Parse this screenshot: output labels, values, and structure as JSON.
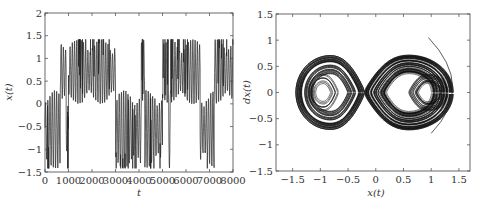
{
  "chart_data": [
    {
      "type": "line",
      "title": "",
      "xlabel": "t",
      "ylabel": "x(t)",
      "xlim": [
        0,
        8000
      ],
      "ylim": [
        -1.5,
        2
      ],
      "xticks": [
        0,
        1000,
        2000,
        3000,
        4000,
        5000,
        6000,
        7000,
        8000
      ],
      "xtick_labels": [
        "0",
        "1000",
        "2000",
        "3000",
        "4000",
        "5000",
        "6000",
        "7000",
        "8000"
      ],
      "yticks": [
        -1.5,
        -1,
        -0.5,
        0,
        0.5,
        1,
        1.5,
        2
      ],
      "ytick_labels": [
        "−1.5",
        "−1",
        "−0.5",
        "0",
        "0.5",
        "1",
        "1.5",
        "2"
      ],
      "grid": false,
      "legend": null,
      "series": [
        {
          "name": "x(t)",
          "description": "chaotic time series switching between two wells",
          "regimes": [
            {
              "t_start": 0,
              "t_end": 650,
              "well": "negative"
            },
            {
              "t_start": 650,
              "t_end": 900,
              "well": "positive"
            },
            {
              "t_start": 900,
              "t_end": 1000,
              "well": "negative"
            },
            {
              "t_start": 1000,
              "t_end": 3000,
              "well": "positive"
            },
            {
              "t_start": 3000,
              "t_end": 4100,
              "well": "negative"
            },
            {
              "t_start": 4100,
              "t_end": 4250,
              "well": "positive"
            },
            {
              "t_start": 4250,
              "t_end": 5000,
              "well": "negative"
            },
            {
              "t_start": 5000,
              "t_end": 5250,
              "well": "positive"
            },
            {
              "t_start": 5250,
              "t_end": 5350,
              "well": "negative"
            },
            {
              "t_start": 5350,
              "t_end": 6600,
              "well": "positive"
            },
            {
              "t_start": 6600,
              "t_end": 7200,
              "well": "negative"
            },
            {
              "t_start": 7200,
              "t_end": 8000,
              "well": "positive"
            }
          ],
          "positive_well": {
            "min": 0.0,
            "max": 1.42
          },
          "negative_well": {
            "min": -1.42,
            "max": 0.3
          }
        }
      ]
    },
    {
      "type": "line",
      "title": "",
      "xlabel": "x(t)",
      "ylabel": "dx(t)",
      "xlim": [
        -1.8,
        1.7
      ],
      "ylim": [
        -1.5,
        1.5
      ],
      "xticks": [
        -1.5,
        -1,
        -0.5,
        0,
        0.5,
        1,
        1.5
      ],
      "xtick_labels": [
        "−1.5",
        "−1",
        "−0.5",
        "0",
        "0.5",
        "1",
        "1.5"
      ],
      "yticks": [
        -1.5,
        -1,
        -0.5,
        0,
        0.5,
        1,
        1.5
      ],
      "ytick_labels": [
        "−1.5",
        "−1",
        "−0.5",
        "0",
        "0.5",
        "1",
        "1.5"
      ],
      "grid": false,
      "legend": null,
      "series": [
        {
          "name": "phase portrait",
          "description": "double-scroll attractor with foci near x=-1 and x=1",
          "left_lobe": {
            "center": [
              -0.95,
              0.0
            ],
            "x_extent": [
              -1.45,
              -0.2
            ],
            "y_extent": [
              -0.75,
              0.68
            ]
          },
          "right_lobe": {
            "center": [
              0.95,
              0.0
            ],
            "x_extent": [
              -0.2,
              1.4
            ],
            "y_extent": [
              -0.65,
              0.78
            ]
          },
          "transient_arc": {
            "start": [
              0.95,
              1.05
            ],
            "end": [
              1.0,
              -0.78
            ],
            "max_x": 1.55
          }
        }
      ]
    }
  ]
}
